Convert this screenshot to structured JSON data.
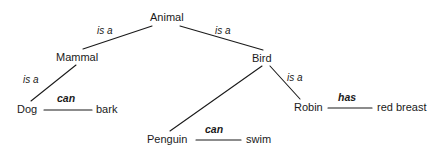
{
  "diagram": {
    "type": "semantic-network",
    "background_color": "#ffffff",
    "line_color": "#1a1a1a",
    "text_color": "#1a1a1a",
    "nodes": [
      {
        "id": "animal",
        "label": "Animal",
        "x": 150,
        "y": 11
      },
      {
        "id": "mammal",
        "label": "Mammal",
        "x": 56,
        "y": 51
      },
      {
        "id": "bird",
        "label": "Bird",
        "x": 252,
        "y": 52
      },
      {
        "id": "dog",
        "label": "Dog",
        "x": 17,
        "y": 103
      },
      {
        "id": "bark",
        "label": "bark",
        "x": 96,
        "y": 103
      },
      {
        "id": "robin",
        "label": "Robin",
        "x": 294,
        "y": 101
      },
      {
        "id": "red-breast",
        "label": "red breast",
        "x": 377,
        "y": 101
      },
      {
        "id": "penguin",
        "label": "Penguin",
        "x": 147,
        "y": 133
      },
      {
        "id": "swim",
        "label": "swim",
        "x": 246,
        "y": 133
      }
    ],
    "edges": [
      {
        "id": "animal-mammal",
        "from": "animal",
        "to": "mammal",
        "label": "is a",
        "style": "italic",
        "x1": 152,
        "y1": 26,
        "x2": 83,
        "y2": 49,
        "label_x": 97,
        "label_y": 25
      },
      {
        "id": "animal-bird",
        "from": "animal",
        "to": "bird",
        "label": "is a",
        "style": "italic",
        "x1": 180,
        "y1": 26,
        "x2": 263,
        "y2": 50,
        "label_x": 215,
        "label_y": 25
      },
      {
        "id": "mammal-dog",
        "from": "mammal",
        "to": "dog",
        "label": "is a",
        "style": "italic",
        "x1": 76,
        "y1": 65,
        "x2": 31,
        "y2": 101,
        "label_x": 23,
        "label_y": 74
      },
      {
        "id": "dog-bark",
        "from": "dog",
        "to": "bark",
        "label": "can",
        "style": "bold-italic",
        "x1": 44,
        "y1": 110,
        "x2": 92,
        "y2": 110,
        "label_x": 57,
        "label_y": 92
      },
      {
        "id": "bird-penguin",
        "from": "bird",
        "to": "penguin",
        "label": "",
        "style": "none",
        "x1": 262,
        "y1": 66,
        "x2": 170,
        "y2": 131,
        "label_x": 0,
        "label_y": 0
      },
      {
        "id": "bird-robin",
        "from": "bird",
        "to": "robin",
        "label": "is a",
        "style": "italic",
        "x1": 270,
        "y1": 66,
        "x2": 300,
        "y2": 99,
        "label_x": 287,
        "label_y": 72
      },
      {
        "id": "robin-redbreast",
        "from": "robin",
        "to": "red breast",
        "label": "has",
        "style": "bold-italic",
        "x1": 328,
        "y1": 108,
        "x2": 372,
        "y2": 108,
        "label_x": 338,
        "label_y": 91
      },
      {
        "id": "penguin-swim",
        "from": "penguin",
        "to": "swim",
        "label": "can",
        "style": "bold-italic",
        "x1": 196,
        "y1": 140,
        "x2": 241,
        "y2": 140,
        "label_x": 205,
        "label_y": 123
      }
    ]
  }
}
